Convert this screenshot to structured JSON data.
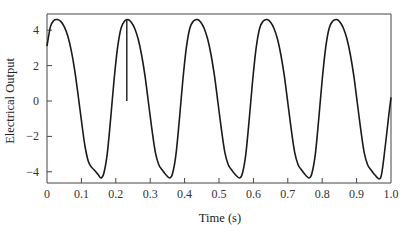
{
  "chart_data": {
    "type": "line",
    "title": "",
    "xlabel": "Time (s)",
    "ylabel": "Electrical Output",
    "xlim": [
      0,
      1.0
    ],
    "ylim": [
      -4.6,
      4.9
    ],
    "grid": false,
    "legend": null,
    "xticks": [
      0,
      0.1,
      0.2,
      0.3,
      0.4,
      0.5,
      0.6,
      0.7,
      0.8,
      0.9,
      1.0
    ],
    "xtick_labels": [
      "0",
      "0.1",
      "0.2",
      "0.3",
      "0.4",
      "0.5",
      "0.6",
      "0.7",
      "0.8",
      "0.9",
      "1.0"
    ],
    "yticks": [
      4,
      2,
      0,
      -2,
      -4
    ],
    "ytick_labels": [
      "4",
      "2",
      "0",
      "−2",
      "−4"
    ],
    "series": [
      {
        "name": "Electrical Output",
        "color": "#1a1a1a",
        "x": [
          0.0,
          0.01,
          0.02,
          0.03,
          0.04,
          0.05,
          0.06,
          0.07,
          0.08,
          0.09,
          0.1,
          0.11,
          0.12,
          0.13,
          0.14,
          0.15,
          0.157,
          0.165,
          0.175,
          0.185,
          0.195,
          0.205,
          0.215,
          0.225,
          0.235,
          0.245,
          0.255,
          0.265,
          0.275,
          0.285,
          0.295,
          0.305,
          0.315,
          0.325,
          0.335,
          0.345,
          0.357,
          0.365,
          0.375,
          0.385,
          0.395,
          0.405,
          0.415,
          0.425,
          0.437,
          0.447,
          0.457,
          0.467,
          0.477,
          0.487,
          0.497,
          0.507,
          0.517,
          0.527,
          0.537,
          0.547,
          0.56,
          0.568,
          0.578,
          0.588,
          0.598,
          0.608,
          0.618,
          0.628,
          0.64,
          0.65,
          0.66,
          0.67,
          0.68,
          0.69,
          0.7,
          0.71,
          0.72,
          0.73,
          0.74,
          0.75,
          0.762,
          0.77,
          0.78,
          0.79,
          0.8,
          0.81,
          0.82,
          0.83,
          0.842,
          0.852,
          0.862,
          0.872,
          0.882,
          0.892,
          0.902,
          0.912,
          0.922,
          0.932,
          0.942,
          0.952,
          0.965,
          0.973,
          0.983,
          0.993,
          1.0
        ],
        "y": [
          3.1,
          4.2,
          4.55,
          4.6,
          4.5,
          4.2,
          3.7,
          2.9,
          1.8,
          0.4,
          -1.1,
          -2.5,
          -3.4,
          -3.75,
          -3.95,
          -4.2,
          -4.35,
          -4.1,
          -3.0,
          -1.0,
          1.2,
          3.0,
          4.1,
          4.5,
          4.6,
          4.45,
          4.1,
          3.5,
          2.6,
          1.4,
          -0.1,
          -1.6,
          -2.9,
          -3.6,
          -3.9,
          -4.15,
          -4.35,
          -4.1,
          -3.0,
          -1.0,
          1.2,
          3.0,
          4.1,
          4.5,
          4.6,
          4.45,
          4.1,
          3.5,
          2.6,
          1.4,
          -0.1,
          -1.6,
          -2.9,
          -3.6,
          -3.9,
          -4.15,
          -4.35,
          -4.1,
          -3.0,
          -1.0,
          1.2,
          3.0,
          4.1,
          4.5,
          4.6,
          4.45,
          4.1,
          3.5,
          2.6,
          1.4,
          -0.1,
          -1.6,
          -2.9,
          -3.6,
          -3.9,
          -4.15,
          -4.35,
          -4.1,
          -3.0,
          -1.0,
          1.2,
          3.0,
          4.1,
          4.5,
          4.6,
          4.45,
          4.1,
          3.5,
          2.6,
          1.4,
          -0.1,
          -1.6,
          -2.9,
          -3.6,
          -3.9,
          -4.15,
          -4.4,
          -4.1,
          -2.6,
          -0.9,
          0.2
        ]
      }
    ],
    "annotations": [
      {
        "type": "vertical_spike",
        "x": 0.232,
        "y_from": 4.6,
        "y_to": 0.0
      }
    ]
  },
  "layout": {
    "plot_left_px": 47,
    "plot_right_px": 391,
    "plot_top_px": 14,
    "plot_bottom_px": 183,
    "y_zero_px": 101,
    "px_per_y_unit": 17.7
  }
}
